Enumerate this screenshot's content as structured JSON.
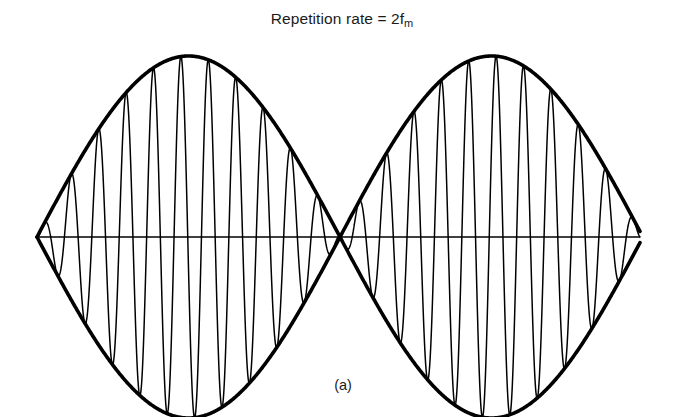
{
  "figure": {
    "title_prefix": "Repetition rate = 2f",
    "title_subscript": "m",
    "title_full": "Repetition rate = 2fm",
    "caption": "(a)",
    "background_color": "#ffffff",
    "ink_color": "#000000"
  },
  "chart_data": {
    "type": "line",
    "title": "Repetition rate = 2fm",
    "subtitle": "(a)",
    "xlabel": "",
    "ylabel": "",
    "grid": false,
    "legend": null,
    "axis_line": {
      "name": "zero-axis",
      "y": 237,
      "x_start": 37,
      "x_end": 640,
      "stroke_width": 1.6
    },
    "geometry": {
      "x_left_node": 37,
      "x_center_node": 343.5,
      "x_right_node": 640,
      "y_zero": 237,
      "y_top_peak": 56,
      "y_bottom_peak": 400,
      "amplitude_px": 181,
      "half_period_px": 303
    },
    "series": [
      {
        "name": "upper-envelope",
        "kind": "envelope",
        "equation": "y = +A * |sin(pi * (x - x0) / L)|",
        "stroke_width": 3.6,
        "lobes": 2
      },
      {
        "name": "lower-envelope",
        "kind": "envelope",
        "equation": "y = -A * |sin(pi * (x - x0) / L)|",
        "stroke_width": 3.6,
        "lobes": 2
      },
      {
        "name": "modulated-carrier",
        "kind": "carrier",
        "equation": "y = A * sin(pi * (x - x0) / L) * sin(2*pi*fc*(x - x0))",
        "stroke_width": 1.5,
        "carrier_cycles_total": 22,
        "carrier_cycles_per_lobe": 11
      }
    ],
    "envelope": {
      "shape": "rectified-sine",
      "node_positions_x": [
        37,
        343.5,
        640
      ],
      "peak_positions_x": [
        190,
        492
      ],
      "peak_amplitude": 181
    },
    "annotations": [
      {
        "text": "Repetition rate = 2fm",
        "x": 342,
        "y": 22,
        "role": "title"
      },
      {
        "text": "(a)",
        "x": 344,
        "y": 389,
        "role": "caption"
      }
    ],
    "xlim": [
      37,
      640
    ],
    "ylim": [
      -181,
      181
    ]
  }
}
